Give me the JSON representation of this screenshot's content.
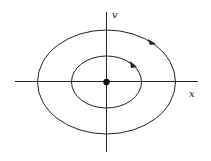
{
  "diagram": {
    "type": "phase-portrait",
    "axes": {
      "x_label": "x",
      "y_label": "v"
    },
    "orbits": [
      {
        "name": "outer",
        "cx": 106,
        "cy": 82,
        "rx": 69,
        "ry": 52,
        "direction": "clockwise"
      },
      {
        "name": "inner",
        "cx": 106,
        "cy": 82,
        "rx": 35,
        "ry": 26,
        "direction": "clockwise"
      }
    ],
    "equilibrium": {
      "x": 106,
      "y": 82,
      "label": "center"
    },
    "colors": {
      "stroke": "#222222",
      "background": "#ffffff"
    }
  }
}
